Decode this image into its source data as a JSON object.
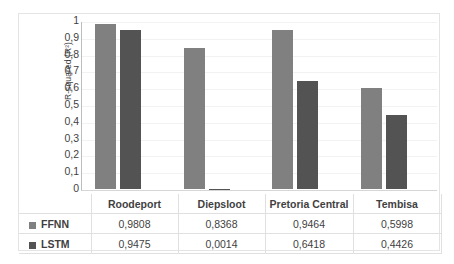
{
  "chart_data": {
    "type": "bar",
    "title": "",
    "xlabel": "",
    "ylabel": "R-squared (R²)",
    "ylim": [
      0,
      1
    ],
    "grid": true,
    "legend_position": "table-left",
    "decimal_separator": ",",
    "categories": [
      "Roodeport",
      "Diepsloot",
      "Pretoria Central",
      "Tembisa"
    ],
    "series": [
      {
        "name": "FFNN",
        "color": "#808080",
        "values": [
          0.9808,
          0.8368,
          0.9464,
          0.5998
        ],
        "labels": [
          "0,9808",
          "0,8368",
          "0,9464",
          "0,5998"
        ]
      },
      {
        "name": "LSTM",
        "color": "#535353",
        "values": [
          0.9475,
          0.0014,
          0.6418,
          0.4426
        ],
        "labels": [
          "0,9475",
          "0,0014",
          "0,6418",
          "0,4426"
        ]
      }
    ],
    "y_ticks": [
      {
        "value": 1.0,
        "label": "1"
      },
      {
        "value": 0.9,
        "label": "0,9"
      },
      {
        "value": 0.8,
        "label": "0,8"
      },
      {
        "value": 0.7,
        "label": "0,7"
      },
      {
        "value": 0.6,
        "label": "0,6"
      },
      {
        "value": 0.5,
        "label": "0,5"
      },
      {
        "value": 0.4,
        "label": "0,4"
      },
      {
        "value": 0.3,
        "label": "0,3"
      },
      {
        "value": 0.2,
        "label": "0,2"
      },
      {
        "value": 0.1,
        "label": "0,1"
      },
      {
        "value": 0.0,
        "label": "0"
      }
    ]
  },
  "colors": {
    "ffnn": "#808080",
    "lstm": "#535353",
    "frame_border": "#e4e4e4",
    "gridline": "#f2f2f2",
    "axis": "#bdbdbd",
    "table_border": "#e0e0e0",
    "text": "#3f3f3f"
  }
}
